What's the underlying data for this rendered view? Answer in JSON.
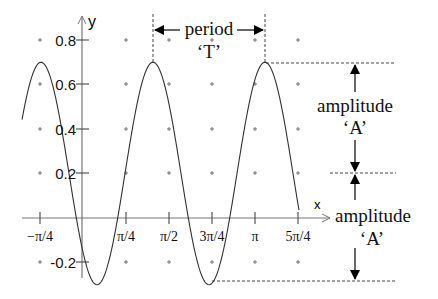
{
  "diagram": {
    "axes": {
      "x_label": "x",
      "y_label": "y",
      "x_ticks": [
        "−π/4",
        "π/4",
        "π/2",
        "3π/4",
        "π",
        "5π/4"
      ],
      "y_ticks": [
        "0.8",
        "0.6",
        "0.4",
        "0.2",
        "-0.2"
      ]
    },
    "annotations": {
      "period_label": "period",
      "period_symbol": "‘T’",
      "amplitude_upper_label": "amplitude",
      "amplitude_upper_symbol": "‘A’",
      "amplitude_lower_label": "amplitude",
      "amplitude_lower_symbol": "‘A’"
    },
    "curve": {
      "center": 0.2,
      "amplitude": 0.5,
      "max": 0.7,
      "min": -0.3,
      "color": "#333333"
    }
  }
}
